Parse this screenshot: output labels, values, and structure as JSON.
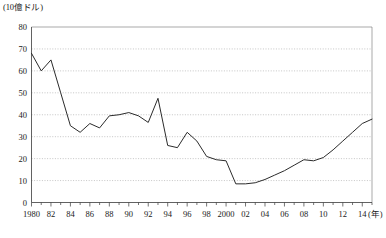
{
  "chart_data": {
    "type": "line",
    "title": "",
    "unit_label": "(10億ドル)",
    "xlabel": "(年)",
    "ylabel": "",
    "ylim": [
      0,
      80
    ],
    "ytick_step": 10,
    "yticks": [
      0,
      10,
      20,
      30,
      40,
      50,
      60,
      70,
      80
    ],
    "xlim": [
      1980,
      2015
    ],
    "xticks": [
      1980,
      1982,
      1984,
      1986,
      1988,
      1990,
      1992,
      1994,
      1996,
      1998,
      2000,
      2002,
      2004,
      2006,
      2008,
      2010,
      2012,
      2014
    ],
    "xtick_labels": [
      "1980",
      "82",
      "84",
      "86",
      "88",
      "90",
      "92",
      "94",
      "96",
      "98",
      "2000",
      "02",
      "04",
      "06",
      "08",
      "10",
      "12",
      "14"
    ],
    "minor_xticks_every": 1,
    "grid": "horizontal-dotted",
    "legend": "none",
    "line_color": "#2b2b2b",
    "x": [
      1980,
      1981,
      1982,
      1983,
      1984,
      1985,
      1986,
      1987,
      1988,
      1989,
      1990,
      1991,
      1992,
      1993,
      1994,
      1995,
      1996,
      1997,
      1998,
      1999,
      2000,
      2001,
      2002,
      2003,
      2004,
      2005,
      2006,
      2007,
      2008,
      2009,
      2010,
      2011,
      2012,
      2013,
      2014,
      2015
    ],
    "values": [
      68,
      60,
      65,
      50,
      35,
      32,
      36,
      34,
      39.5,
      40,
      41,
      39.5,
      36.5,
      47.5,
      26,
      25,
      32,
      28,
      21,
      19.5,
      19,
      8.5,
      8.5,
      9,
      10.5,
      12.5,
      14.5,
      17,
      19.5,
      19,
      20.5,
      24,
      28,
      32,
      36,
      38
    ],
    "series": [
      {
        "name": "series-1",
        "values": [
          68,
          60,
          65,
          50,
          35,
          32,
          36,
          34,
          39.5,
          40,
          41,
          39.5,
          36.5,
          47.5,
          26,
          25,
          32,
          28,
          21,
          19.5,
          19,
          8.5,
          8.5,
          9,
          10.5,
          12.5,
          14.5,
          17,
          19.5,
          19,
          20.5,
          24,
          28,
          32,
          36,
          38
        ]
      }
    ]
  }
}
